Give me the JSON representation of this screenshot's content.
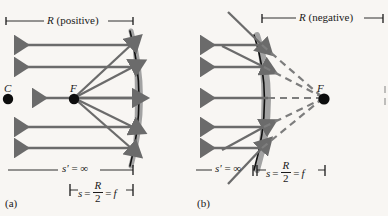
{
  "figure": {
    "type": "optics-ray-diagram",
    "background_color": "#f8f6f3",
    "ray_color": "#6b6b6b",
    "mirror_line_color": "#111111",
    "mirror_fill_color": "#9c9c9c",
    "text_color": "#1a1a1a"
  },
  "panels": [
    {
      "id": "a",
      "label": "(a)",
      "mirror_type": "concave",
      "top_dimension": {
        "symbol": "R",
        "qualifier": "(positive)",
        "text": "R (positive)"
      },
      "points": [
        {
          "name": "center-of-curvature",
          "label": "C"
        },
        {
          "name": "focal-point",
          "label": "F"
        }
      ],
      "object_distance_label": {
        "symbol": "s'",
        "relation": "=",
        "value": "∞",
        "text": "s' = ∞"
      },
      "image_distance_label": {
        "symbol": "s",
        "relation": "=",
        "numerator": "R",
        "denominator": "2",
        "equals": "=",
        "focal": "f",
        "text": "s = R/2 = f"
      },
      "incoming_ray_count": 5,
      "reflected_ray_count": 4
    },
    {
      "id": "b",
      "label": "(b)",
      "mirror_type": "convex",
      "top_dimension": {
        "symbol": "R",
        "qualifier": "(negative)",
        "text": "R (negative)"
      },
      "points": [
        {
          "name": "focal-point",
          "label": "F"
        }
      ],
      "object_distance_label": {
        "symbol": "s'",
        "relation": "=",
        "value": "∞",
        "text": "s' = ∞"
      },
      "image_distance_label": {
        "symbol": "s",
        "relation": "=",
        "numerator": "R",
        "denominator": "2",
        "equals": "=",
        "focal": "f",
        "text": "s = R/2 = f"
      },
      "incoming_ray_count": 5,
      "reflected_ray_count": 4,
      "virtual_ray_count": 5
    }
  ]
}
